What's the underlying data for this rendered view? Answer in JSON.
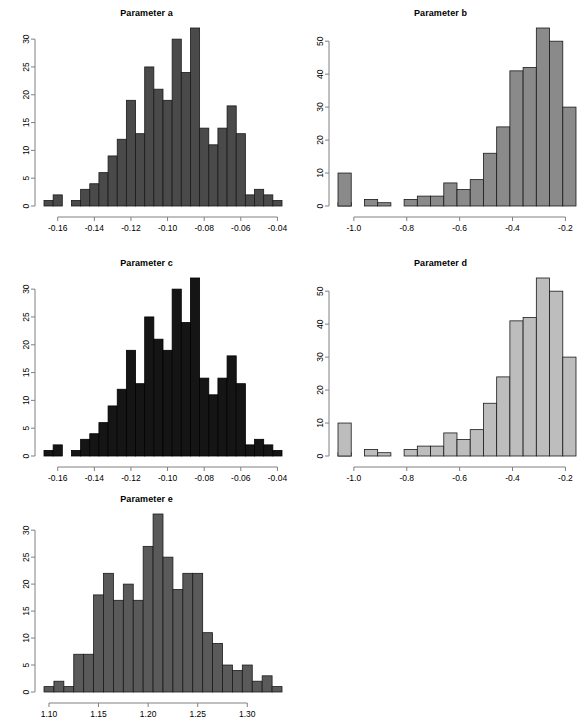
{
  "figure": {
    "background_color": "#ffffff",
    "axis_color": "#808080",
    "text_color": "#000000",
    "panel_count": 5,
    "layout": "3 rows x 2 columns (last row single panel)"
  },
  "chart_data": [
    {
      "type": "bar",
      "subtype": "histogram",
      "title": "Parameter a",
      "xlabel": "",
      "ylabel": "",
      "grid": false,
      "legend": null,
      "fill_color": "#4a4a4a",
      "border_color": "#1a1a1a",
      "xlim": [
        -0.1675,
        -0.0375
      ],
      "ylim": [
        0,
        32
      ],
      "xticks": [
        "-0.16",
        "-0.14",
        "-0.12",
        "-0.10",
        "-0.08",
        "-0.06",
        "-0.04"
      ],
      "xtick_values": [
        -0.16,
        -0.14,
        -0.12,
        -0.1,
        -0.08,
        -0.06,
        -0.04
      ],
      "yticks": [
        "0",
        "5",
        "10",
        "15",
        "20",
        "25",
        "30"
      ],
      "ytick_values": [
        0,
        5,
        10,
        15,
        20,
        25,
        30
      ],
      "bin_width": 0.005,
      "bin_starts": [
        -0.1675,
        -0.1625,
        -0.1575,
        -0.1525,
        -0.1475,
        -0.1425,
        -0.1375,
        -0.1325,
        -0.1275,
        -0.1225,
        -0.1175,
        -0.1125,
        -0.1075,
        -0.1025,
        -0.0975,
        -0.0925,
        -0.0875,
        -0.0825,
        -0.0775,
        -0.0725,
        -0.0675,
        -0.0625,
        -0.0575,
        -0.0525,
        -0.0475,
        -0.0425
      ],
      "values": [
        1,
        2,
        0,
        1,
        3,
        4,
        6,
        9,
        12,
        19,
        13,
        25,
        21,
        19,
        30,
        24,
        32,
        14,
        11,
        14,
        18,
        13,
        2,
        3,
        2,
        1
      ]
    },
    {
      "type": "bar",
      "subtype": "histogram",
      "title": "Parameter b",
      "xlabel": "",
      "ylabel": "",
      "grid": false,
      "legend": null,
      "fill_color": "#8a8a8a",
      "border_color": "#1a1a1a",
      "xlim": [
        -1.06,
        -0.16
      ],
      "ylim": [
        0,
        54
      ],
      "xticks": [
        "-1.0",
        "-0.8",
        "-0.6",
        "-0.4",
        "-0.2"
      ],
      "xtick_values": [
        -1.0,
        -0.8,
        -0.6,
        -0.4,
        -0.2
      ],
      "yticks": [
        "0",
        "10",
        "20",
        "30",
        "40",
        "50"
      ],
      "ytick_values": [
        0,
        10,
        20,
        30,
        40,
        50
      ],
      "bin_width": 0.05,
      "bin_starts": [
        -1.06,
        -1.01,
        -0.96,
        -0.91,
        -0.86,
        -0.81,
        -0.76,
        -0.71,
        -0.66,
        -0.61,
        -0.56,
        -0.51,
        -0.46,
        -0.41,
        -0.36,
        -0.31,
        -0.26,
        -0.21
      ],
      "values": [
        1,
        0,
        2,
        1,
        0,
        2,
        3,
        3,
        7,
        5,
        8,
        16,
        24,
        41,
        42,
        54,
        50,
        30,
        10
      ]
    },
    {
      "type": "bar",
      "subtype": "histogram",
      "title": "Parameter c",
      "xlabel": "",
      "ylabel": "",
      "grid": false,
      "legend": null,
      "fill_color": "#151515",
      "border_color": "#000000",
      "xlim": [
        -0.1675,
        -0.0375
      ],
      "ylim": [
        0,
        32
      ],
      "xticks": [
        "-0.16",
        "-0.14",
        "-0.12",
        "-0.10",
        "-0.08",
        "-0.06",
        "-0.04"
      ],
      "xtick_values": [
        -0.16,
        -0.14,
        -0.12,
        -0.1,
        -0.08,
        -0.06,
        -0.04
      ],
      "yticks": [
        "0",
        "5",
        "10",
        "15",
        "20",
        "25",
        "30"
      ],
      "ytick_values": [
        0,
        5,
        10,
        15,
        20,
        25,
        30
      ],
      "bin_width": 0.005,
      "bin_starts": [
        -0.1675,
        -0.1625,
        -0.1575,
        -0.1525,
        -0.1475,
        -0.1425,
        -0.1375,
        -0.1325,
        -0.1275,
        -0.1225,
        -0.1175,
        -0.1125,
        -0.1075,
        -0.1025,
        -0.0975,
        -0.0925,
        -0.0875,
        -0.0825,
        -0.0775,
        -0.0725,
        -0.0675,
        -0.0625,
        -0.0575,
        -0.0525,
        -0.0475,
        -0.0425
      ],
      "values": [
        1,
        2,
        0,
        1,
        3,
        4,
        6,
        9,
        12,
        19,
        13,
        25,
        21,
        19,
        30,
        24,
        32,
        14,
        11,
        14,
        18,
        13,
        2,
        3,
        2,
        1
      ]
    },
    {
      "type": "bar",
      "subtype": "histogram",
      "title": "Parameter d",
      "xlabel": "",
      "ylabel": "",
      "grid": false,
      "legend": null,
      "fill_color": "#bdbdbd",
      "border_color": "#1a1a1a",
      "xlim": [
        -1.06,
        -0.16
      ],
      "ylim": [
        0,
        54
      ],
      "xticks": [
        "-1.0",
        "-0.8",
        "-0.6",
        "-0.4",
        "-0.2"
      ],
      "xtick_values": [
        -1.0,
        -0.8,
        -0.6,
        -0.4,
        -0.2
      ],
      "yticks": [
        "0",
        "10",
        "20",
        "30",
        "40",
        "50"
      ],
      "ytick_values": [
        0,
        10,
        20,
        30,
        40,
        50
      ],
      "bin_width": 0.05,
      "bin_starts": [
        -1.06,
        -1.01,
        -0.96,
        -0.91,
        -0.86,
        -0.81,
        -0.76,
        -0.71,
        -0.66,
        -0.61,
        -0.56,
        -0.51,
        -0.46,
        -0.41,
        -0.36,
        -0.31,
        -0.26,
        -0.21
      ],
      "values": [
        1,
        0,
        2,
        1,
        0,
        2,
        3,
        3,
        7,
        5,
        8,
        16,
        24,
        41,
        42,
        54,
        50,
        30,
        10
      ]
    },
    {
      "type": "bar",
      "subtype": "histogram",
      "title": "Parameter e",
      "xlabel": "",
      "ylabel": "",
      "grid": false,
      "legend": null,
      "fill_color": "#5a5a5a",
      "border_color": "#1a1a1a",
      "xlim": [
        1.095,
        1.335
      ],
      "ylim": [
        0,
        33
      ],
      "xticks": [
        "1.10",
        "1.15",
        "1.20",
        "1.25",
        "1.30"
      ],
      "xtick_values": [
        1.1,
        1.15,
        1.2,
        1.25,
        1.3
      ],
      "yticks": [
        "0",
        "5",
        "10",
        "15",
        "20",
        "25",
        "30"
      ],
      "ytick_values": [
        0,
        5,
        10,
        15,
        20,
        25,
        30
      ],
      "bin_width": 0.01,
      "bin_starts": [
        1.095,
        1.105,
        1.115,
        1.125,
        1.135,
        1.145,
        1.155,
        1.165,
        1.175,
        1.185,
        1.195,
        1.205,
        1.215,
        1.225,
        1.235,
        1.245,
        1.255,
        1.265,
        1.275,
        1.285,
        1.295,
        1.305,
        1.315,
        1.325
      ],
      "values": [
        1,
        2,
        1,
        7,
        7,
        18,
        22,
        17,
        20,
        17,
        27,
        33,
        25,
        19,
        22,
        22,
        11,
        9,
        5,
        4,
        5,
        2,
        3,
        1
      ]
    }
  ],
  "panels": [
    {
      "name": "panel-parameter-a",
      "x": 0,
      "y": 4,
      "w": 293,
      "h": 248,
      "chart_index": 0
    },
    {
      "name": "panel-parameter-b",
      "x": 294,
      "y": 4,
      "w": 293,
      "h": 248,
      "chart_index": 1
    },
    {
      "name": "panel-parameter-c",
      "x": 0,
      "y": 256,
      "w": 293,
      "h": 236,
      "chart_index": 2
    },
    {
      "name": "panel-parameter-d",
      "x": 294,
      "y": 256,
      "w": 293,
      "h": 236,
      "chart_index": 3
    },
    {
      "name": "panel-parameter-e",
      "x": 0,
      "y": 492,
      "w": 293,
      "h": 225,
      "chart_index": 4
    }
  ]
}
